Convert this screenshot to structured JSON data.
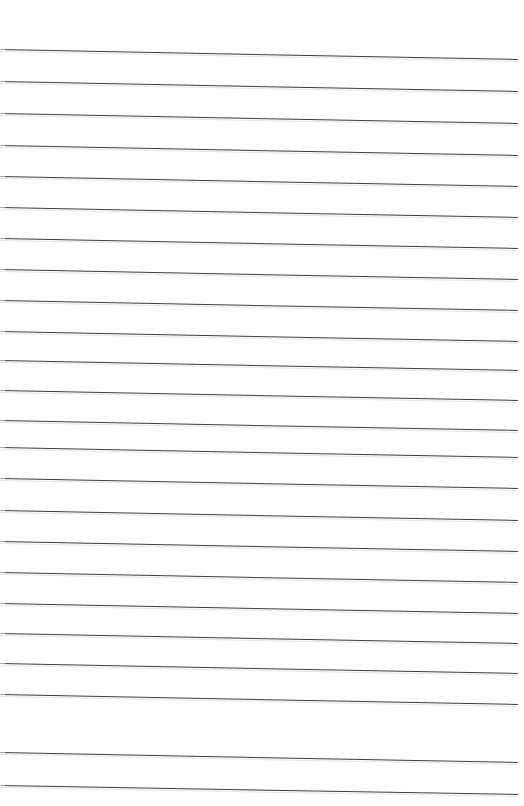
{
  "document": {
    "kind": "scanned-ruled-paper",
    "title": "Blank Ruled Notebook Page",
    "page_width": 524,
    "page_height": 806,
    "background_color": "#ffffff",
    "has_text": false,
    "has_margin_rule": false,
    "has_header": false,
    "has_page_number": false,
    "visible_text": ""
  },
  "ruling": {
    "line_color": "#3a3a40",
    "line_thickness_px": 1,
    "line_count": 24,
    "line_spacing_px": 32,
    "first_line_left_y": 49,
    "last_line_left_y": 785,
    "line_start_x": 0,
    "line_end_x": 518,
    "skew_degrees": 1.05,
    "skew_drop_px": 9.6,
    "top_margin_px": 49,
    "bottom_margin_px": 21
  },
  "lines": [
    {
      "index": 1,
      "left_y": 49,
      "right_y": 59,
      "length": 518
    },
    {
      "index": 2,
      "left_y": 81,
      "right_y": 91,
      "length": 518
    },
    {
      "index": 3,
      "left_y": 113,
      "right_y": 123,
      "length": 518
    },
    {
      "index": 4,
      "left_y": 145,
      "right_y": 155,
      "length": 518
    },
    {
      "index": 5,
      "left_y": 176,
      "right_y": 186,
      "length": 518
    },
    {
      "index": 6,
      "left_y": 207,
      "right_y": 217,
      "length": 518
    },
    {
      "index": 7,
      "left_y": 238,
      "right_y": 248,
      "length": 518
    },
    {
      "index": 8,
      "left_y": 269,
      "right_y": 279,
      "length": 518
    },
    {
      "index": 9,
      "left_y": 300,
      "right_y": 310,
      "length": 518
    },
    {
      "index": 10,
      "left_y": 331,
      "right_y": 341,
      "length": 518
    },
    {
      "index": 11,
      "left_y": 360,
      "right_y": 370,
      "length": 518
    },
    {
      "index": 12,
      "left_y": 390,
      "right_y": 400,
      "length": 518
    },
    {
      "index": 13,
      "left_y": 420,
      "right_y": 430,
      "length": 518
    },
    {
      "index": 14,
      "left_y": 447,
      "right_y": 457,
      "length": 518
    },
    {
      "index": 15,
      "left_y": 478,
      "right_y": 488,
      "length": 518
    },
    {
      "index": 16,
      "left_y": 510,
      "right_y": 520,
      "length": 518
    },
    {
      "index": 17,
      "left_y": 541,
      "right_y": 551,
      "length": 518
    },
    {
      "index": 18,
      "left_y": 572,
      "right_y": 582,
      "length": 518
    },
    {
      "index": 19,
      "left_y": 603,
      "right_y": 613,
      "length": 518
    },
    {
      "index": 20,
      "left_y": 633,
      "right_y": 643,
      "length": 518
    },
    {
      "index": 21,
      "left_y": 663,
      "right_y": 673,
      "length": 518
    },
    {
      "index": 22,
      "left_y": 694,
      "right_y": 704,
      "length": 518
    },
    {
      "index": 23,
      "left_y": 752,
      "right_y": 762,
      "length": 518
    },
    {
      "index": 24,
      "left_y": 785,
      "right_y": 794,
      "length": 518
    }
  ]
}
